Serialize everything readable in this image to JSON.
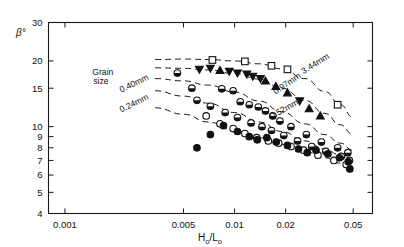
{
  "chart_data": {
    "type": "scatter",
    "title": "",
    "xlabel": "H₀/L₀",
    "ylabel": "β°",
    "xscale": "log",
    "yscale": "log",
    "xlim": [
      0.0008,
      0.065
    ],
    "ylim": [
      4,
      30
    ],
    "grid": false,
    "legend_position": "inline-curve-labels",
    "xticks": [
      0.001,
      0.005,
      0.01,
      0.02,
      0.05
    ],
    "xticklabels": [
      "0.001",
      "0.005",
      "0.01",
      "0.02",
      "0.05"
    ],
    "yticks": [
      4,
      5,
      6,
      7,
      8,
      9,
      10,
      15,
      20,
      30
    ],
    "yticklabels": [
      "4",
      "5",
      "6",
      "7",
      "8",
      "9",
      "10",
      "15",
      "20",
      "30"
    ],
    "annotations": [
      {
        "name": "grain-size-note",
        "text": "Grain",
        "x": 0.00145,
        "y": 17.2
      },
      {
        "name": "grain-size-note-2",
        "text": "size",
        "x": 0.00147,
        "y": 15.6
      }
    ],
    "series": [
      {
        "name": "3.44mm",
        "label": "3.44 mm",
        "marker": "square-open",
        "trend": [
          [
            0.0034,
            20.3
          ],
          [
            0.005,
            20.4
          ],
          [
            0.007,
            20.3
          ],
          [
            0.01,
            20.0
          ],
          [
            0.014,
            19.4
          ],
          [
            0.019,
            18.4
          ],
          [
            0.026,
            16.6
          ],
          [
            0.034,
            14.5
          ],
          [
            0.042,
            12.6
          ],
          [
            0.05,
            11.0
          ]
        ],
        "points": [
          [
            0.0074,
            20.2
          ],
          [
            0.0115,
            19.9
          ],
          [
            0.0165,
            19.0
          ],
          [
            0.0205,
            18.3
          ],
          [
            0.0405,
            12.6
          ]
        ]
      },
      {
        "name": "0.97mm",
        "label": "0.97 mm",
        "marker": "triangle-filled",
        "trend": [
          [
            0.0034,
            18.6
          ],
          [
            0.005,
            18.5
          ],
          [
            0.007,
            18.2
          ],
          [
            0.01,
            17.5
          ],
          [
            0.014,
            16.5
          ],
          [
            0.019,
            15.0
          ],
          [
            0.026,
            13.2
          ],
          [
            0.034,
            11.5
          ],
          [
            0.042,
            10.2
          ],
          [
            0.05,
            9.2
          ]
        ],
        "points": [
          [
            0.0062,
            18.3
          ],
          [
            0.0072,
            18.5
          ],
          [
            0.0082,
            18.1
          ],
          [
            0.0093,
            17.9
          ],
          [
            0.0104,
            17.6
          ],
          [
            0.0118,
            17.4
          ],
          [
            0.0128,
            17.0
          ],
          [
            0.0142,
            16.6
          ],
          [
            0.0152,
            16.2
          ],
          [
            0.0175,
            15.3
          ],
          [
            0.0205,
            14.3
          ],
          [
            0.0242,
            13.1
          ],
          [
            0.0275,
            12.1
          ],
          [
            0.032,
            11.2
          ]
        ]
      },
      {
        "name": "0.52mm",
        "label": "0.52 mm",
        "marker": "circle-half",
        "trend": [
          [
            0.0034,
            16.6
          ],
          [
            0.005,
            16.2
          ],
          [
            0.007,
            15.5
          ],
          [
            0.01,
            14.4
          ],
          [
            0.014,
            13.1
          ],
          [
            0.019,
            11.7
          ],
          [
            0.026,
            10.3
          ],
          [
            0.034,
            9.2
          ],
          [
            0.042,
            8.4
          ],
          [
            0.05,
            7.8
          ]
        ],
        "points": [
          [
            0.0046,
            17.6
          ],
          [
            0.0056,
            15.0
          ],
          [
            0.0084,
            14.9
          ],
          [
            0.0098,
            14.6
          ],
          [
            0.0108,
            13.0
          ],
          [
            0.0122,
            12.6
          ],
          [
            0.0138,
            12.3
          ],
          [
            0.0152,
            11.8
          ],
          [
            0.0168,
            11.2
          ],
          [
            0.0185,
            10.6
          ],
          [
            0.0215,
            10.0
          ],
          [
            0.0265,
            9.2
          ],
          [
            0.0325,
            8.5
          ],
          [
            0.0405,
            8.0
          ],
          [
            0.0465,
            7.6
          ]
        ]
      },
      {
        "name": "0.40mm",
        "label": "0.40 mm",
        "marker": "circle-half",
        "trend": [
          [
            0.0034,
            14.6
          ],
          [
            0.005,
            13.8
          ],
          [
            0.007,
            12.8
          ],
          [
            0.01,
            11.6
          ],
          [
            0.014,
            10.5
          ],
          [
            0.019,
            9.5
          ],
          [
            0.026,
            8.6
          ],
          [
            0.034,
            7.9
          ],
          [
            0.042,
            7.4
          ],
          [
            0.05,
            7.0
          ]
        ],
        "points": [
          [
            0.006,
            13.2
          ],
          [
            0.0072,
            12.4
          ],
          [
            0.0088,
            11.6
          ],
          [
            0.0104,
            11.0
          ],
          [
            0.0125,
            10.4
          ],
          [
            0.0145,
            10.0
          ],
          [
            0.0165,
            9.6
          ],
          [
            0.0195,
            9.1
          ],
          [
            0.0235,
            8.6
          ],
          [
            0.0285,
            8.1
          ],
          [
            0.0345,
            7.7
          ],
          [
            0.0425,
            7.3
          ],
          [
            0.0475,
            7.0
          ]
        ]
      },
      {
        "name": "0.24mm",
        "label": "0.24 mm",
        "marker": "circle-open",
        "trend": [
          [
            0.0034,
            12.2
          ],
          [
            0.005,
            11.4
          ],
          [
            0.007,
            10.5
          ],
          [
            0.01,
            9.6
          ],
          [
            0.014,
            8.9
          ],
          [
            0.019,
            8.3
          ],
          [
            0.026,
            7.7
          ],
          [
            0.034,
            7.2
          ],
          [
            0.042,
            6.8
          ],
          [
            0.05,
            6.5
          ]
        ],
        "points": [
          [
            0.0068,
            11.2
          ],
          [
            0.0082,
            10.3
          ],
          [
            0.0098,
            9.8
          ],
          [
            0.0115,
            9.3
          ],
          [
            0.0135,
            8.9
          ],
          [
            0.0158,
            8.6
          ],
          [
            0.0182,
            8.4
          ],
          [
            0.0215,
            8.1
          ],
          [
            0.0255,
            7.8
          ],
          [
            0.031,
            7.4
          ],
          [
            0.0385,
            7.0
          ],
          [
            0.0455,
            6.7
          ]
        ]
      },
      {
        "name": "0.24mm-filled",
        "label": "",
        "marker": "circle-filled",
        "trend": [],
        "points": [
          [
            0.006,
            8.0
          ],
          [
            0.0072,
            9.2
          ],
          [
            0.0086,
            10.1
          ],
          [
            0.0104,
            9.5
          ],
          [
            0.0122,
            9.0
          ],
          [
            0.0136,
            8.7
          ],
          [
            0.0155,
            8.9
          ],
          [
            0.0176,
            8.5
          ],
          [
            0.0205,
            8.2
          ],
          [
            0.0238,
            7.9
          ],
          [
            0.0268,
            7.6
          ],
          [
            0.0302,
            7.8
          ],
          [
            0.0355,
            7.5
          ],
          [
            0.0415,
            7.2
          ],
          [
            0.0468,
            6.9
          ],
          [
            0.0478,
            6.4
          ]
        ]
      }
    ],
    "curve_labels": [
      {
        "name": "label-3-44mm",
        "text": "3.44mm",
        "x": 0.0255,
        "y": 17.4,
        "rotate": -32
      },
      {
        "name": "label-0-97mm",
        "text": "0.97mm",
        "x": 0.0175,
        "y": 14.0,
        "rotate": -35
      },
      {
        "name": "label-0-52mm",
        "text": "0.52mm",
        "x": 0.0166,
        "y": 10.8,
        "rotate": -30
      },
      {
        "name": "label-0-40mm",
        "text": "0.40mm",
        "x": 0.00215,
        "y": 14.3,
        "rotate": -26
      },
      {
        "name": "label-0-24mm",
        "text": "0.24mm",
        "x": 0.00215,
        "y": 11.6,
        "rotate": -26
      }
    ]
  }
}
